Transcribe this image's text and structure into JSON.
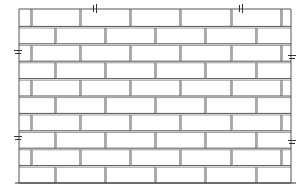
{
  "diagram": {
    "type": "brick-wall-elevation",
    "bond": "running bond (stretcher bond), half-brick offset",
    "colors": {
      "background": "#ffffff",
      "line": "#555555",
      "mortar_shadow": "#9a9a9a"
    },
    "wall": {
      "left": 19,
      "top": 9,
      "right": 291,
      "bottom": 183,
      "rows": 10
    },
    "row_height": 17.4,
    "brick_length": 50,
    "odd_row_joints": [
      31,
      80,
      130,
      180,
      231,
      281
    ],
    "even_row_joints": [
      55,
      105,
      155,
      205,
      256
    ],
    "break_symbols": {
      "top": [
        95,
        241
      ],
      "left": [
        52,
        138
      ],
      "right": [
        57,
        142
      ]
    },
    "ground_line": {
      "x1": 15,
      "x2": 296,
      "y": 183
    }
  }
}
